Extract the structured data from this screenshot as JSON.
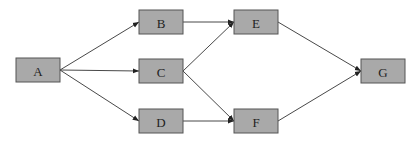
{
  "diagram": {
    "type": "directed-graph",
    "nodes": [
      {
        "id": "A",
        "label": "A"
      },
      {
        "id": "B",
        "label": "B"
      },
      {
        "id": "C",
        "label": "C"
      },
      {
        "id": "D",
        "label": "D"
      },
      {
        "id": "E",
        "label": "E"
      },
      {
        "id": "F",
        "label": "F"
      },
      {
        "id": "G",
        "label": "G"
      }
    ],
    "edges": [
      {
        "from": "A",
        "to": "B"
      },
      {
        "from": "A",
        "to": "C"
      },
      {
        "from": "A",
        "to": "D"
      },
      {
        "from": "B",
        "to": "E"
      },
      {
        "from": "C",
        "to": "E"
      },
      {
        "from": "C",
        "to": "F"
      },
      {
        "from": "D",
        "to": "F"
      },
      {
        "from": "E",
        "to": "G"
      },
      {
        "from": "F",
        "to": "G"
      }
    ],
    "colors": {
      "node_fill": "#a9a9a9",
      "node_border": "#555555",
      "edge": "#333333"
    }
  }
}
